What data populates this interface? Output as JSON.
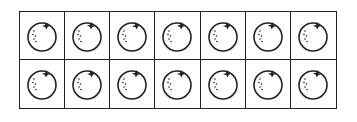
{
  "ten_frame": {
    "rows": 2,
    "columns": 7,
    "item": "orange",
    "count": 14,
    "cells": [
      {
        "row": 0,
        "col": 0,
        "item": "orange"
      },
      {
        "row": 0,
        "col": 1,
        "item": "orange"
      },
      {
        "row": 0,
        "col": 2,
        "item": "orange"
      },
      {
        "row": 0,
        "col": 3,
        "item": "orange"
      },
      {
        "row": 0,
        "col": 4,
        "item": "orange"
      },
      {
        "row": 0,
        "col": 5,
        "item": "orange"
      },
      {
        "row": 0,
        "col": 6,
        "item": "orange"
      },
      {
        "row": 1,
        "col": 0,
        "item": "orange"
      },
      {
        "row": 1,
        "col": 1,
        "item": "orange"
      },
      {
        "row": 1,
        "col": 2,
        "item": "orange"
      },
      {
        "row": 1,
        "col": 3,
        "item": "orange"
      },
      {
        "row": 1,
        "col": 4,
        "item": "orange"
      },
      {
        "row": 1,
        "col": 5,
        "item": "orange"
      },
      {
        "row": 1,
        "col": 6,
        "item": "orange"
      }
    ],
    "colors": {
      "line": "#222222",
      "background": "#ffffff"
    }
  }
}
